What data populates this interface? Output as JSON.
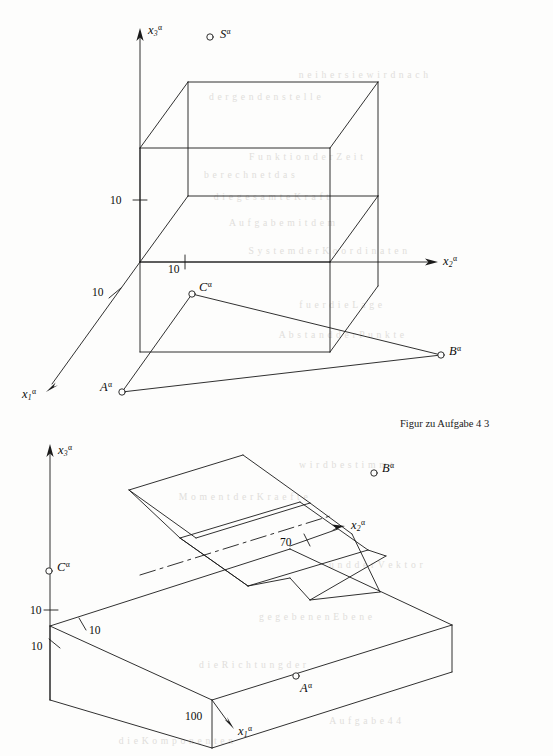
{
  "page": {
    "width": 553,
    "height": 756,
    "background": "#fdfdfc",
    "ink": "#111111"
  },
  "caption": {
    "text": "Figur zu Aufgabe 4 3",
    "x": 400,
    "y": 418
  },
  "figures": [
    {
      "id": "upper",
      "name": "wireframe-box-with-triangle",
      "description": "Axonometric wireframe box with coordinate axes and triangle A-B-C plus free point S",
      "axes": [
        {
          "name": "x3",
          "label": "x",
          "sub": "3",
          "sup": "α",
          "label_x": 148,
          "label_y": 24,
          "direction": "up"
        },
        {
          "name": "x2",
          "label": "x",
          "sub": "2",
          "sup": "α",
          "label_x": 443,
          "label_y": 255,
          "direction": "right"
        },
        {
          "name": "x1",
          "label": "x",
          "sub": "1",
          "sup": "α",
          "label_x": 22,
          "label_y": 388,
          "direction": "down-left"
        }
      ],
      "ticks": [
        {
          "value": "10",
          "axis": "x3",
          "x": 110,
          "y": 195
        },
        {
          "value": "10",
          "axis": "x2",
          "x": 168,
          "y": 264
        },
        {
          "value": "10",
          "axis": "x1",
          "x": 92,
          "y": 287
        }
      ],
      "points": [
        {
          "name": "S",
          "label": "S",
          "sup": "α",
          "marker_x": 210,
          "marker_y": 37,
          "label_x": 220,
          "label_y": 28
        },
        {
          "name": "C",
          "label": "C",
          "sup": "α",
          "marker_x": 192,
          "marker_y": 294,
          "label_x": 199,
          "label_y": 281
        },
        {
          "name": "B",
          "label": "B",
          "sup": "α",
          "marker_x": 441,
          "marker_y": 355,
          "label_x": 449,
          "label_y": 345
        },
        {
          "name": "A",
          "label": "A",
          "sup": "α",
          "marker_x": 122,
          "marker_y": 392,
          "label_x": 100,
          "label_y": 381
        }
      ]
    },
    {
      "id": "lower",
      "name": "slab-with-v-groove",
      "description": "Axonometric rectangular slab with a trapezoidal V-groove cut diagonally through it",
      "axes": [
        {
          "name": "x3",
          "label": "x",
          "sub": "3",
          "sup": "α",
          "label_x": 58,
          "label_y": 444,
          "direction": "up"
        },
        {
          "name": "x2",
          "label": "x",
          "sub": "2",
          "sup": "α",
          "label_x": 351,
          "label_y": 519,
          "direction": "up-right"
        },
        {
          "name": "x1",
          "label": "x",
          "sub": "1",
          "sup": "α",
          "label_x": 238,
          "label_y": 725,
          "direction": "down-right"
        }
      ],
      "ticks": [
        {
          "value": "10",
          "axis": "x3",
          "x": 30,
          "y": 605
        },
        {
          "value": "10",
          "axis": "x2",
          "x": 89,
          "y": 625
        },
        {
          "value": "10",
          "axis": "x1",
          "x": 31,
          "y": 641
        },
        {
          "value": "70",
          "axis": "x2",
          "x": 280,
          "y": 537
        },
        {
          "value": "100",
          "axis": "x1",
          "x": 185,
          "y": 711
        }
      ],
      "points": [
        {
          "name": "C",
          "label": "C",
          "sup": "α",
          "marker_x": 49,
          "marker_y": 571,
          "label_x": 57,
          "label_y": 561
        },
        {
          "name": "B",
          "label": "B",
          "sup": "α",
          "marker_x": 374,
          "marker_y": 473,
          "label_x": 382,
          "label_y": 462
        },
        {
          "name": "A",
          "label": "A",
          "sup": "α",
          "marker_x": 296,
          "marker_y": 676,
          "label_x": 300,
          "label_y": 682
        }
      ]
    }
  ],
  "bleed_text": [
    {
      "text": "n e i  h e r  s i e  w i r d  n a c h",
      "x": 300,
      "y": 70
    },
    {
      "text": "d e r  g e n  d e n  s t e l l e",
      "x": 210,
      "y": 92
    },
    {
      "text": "F u n k t i o n  d e r  Z e i t",
      "x": 250,
      "y": 152
    },
    {
      "text": "b e r e c h n e t  d a s",
      "x": 205,
      "y": 170
    },
    {
      "text": "d i e  g e s a m t e  K r a f t",
      "x": 215,
      "y": 192
    },
    {
      "text": "A u f g a b e  m i t  d e m",
      "x": 230,
      "y": 218
    },
    {
      "text": "S y s t e m  d e r  K o o r d i n a t e n",
      "x": 250,
      "y": 246
    },
    {
      "text": "f u e r  d i e  L a g e",
      "x": 300,
      "y": 300
    },
    {
      "text": "A b s t a n d  d e r  P u n k t e",
      "x": 280,
      "y": 330
    },
    {
      "text": "w i r d  b e s t i m m t",
      "x": 300,
      "y": 460
    },
    {
      "text": "M o m e n t  d e r  K r a e f t e",
      "x": 180,
      "y": 492
    },
    {
      "text": "u n d  d e r  V e k t o r",
      "x": 330,
      "y": 560
    },
    {
      "text": "g e g e b e n e n  E b e n e",
      "x": 260,
      "y": 612
    },
    {
      "text": "d i e  R i c h t u n g  d e r",
      "x": 200,
      "y": 660
    },
    {
      "text": "A u f g a b e  4  4",
      "x": 330,
      "y": 716
    },
    {
      "text": "d i e  K o m p o n e n t e n",
      "x": 120,
      "y": 736
    }
  ]
}
